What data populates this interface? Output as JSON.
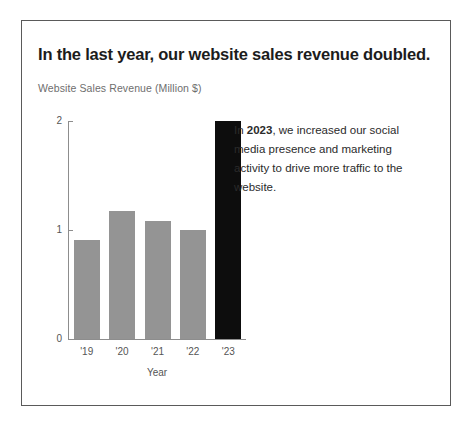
{
  "card": {
    "title": "In the last year, our website sales revenue doubled.",
    "subtitle": "Website Sales Revenue (Million $)"
  },
  "annotation": {
    "highlight": "2023",
    "prefix": "In ",
    "body": ", we increased our social media presence and marketing activity to drive more traffic to the website."
  },
  "colors": {
    "bar_default": "#949494",
    "bar_highlight": "#0d0d0d",
    "axis": "#8d8d8d",
    "card_border": "#5a5a5a",
    "title_text": "#1c1c1c",
    "subtitle_text": "#6e6e6e"
  },
  "chart_data": {
    "type": "bar",
    "title": "In the last year, our website sales revenue doubled.",
    "subtitle": "Website Sales Revenue (Million $)",
    "xlabel": "Year",
    "ylabel": "Website Sales Revenue (Million $)",
    "categories": [
      "'19",
      "'20",
      "'21",
      "'22",
      "'23"
    ],
    "values": [
      0.91,
      1.17,
      1.08,
      1.0,
      2.0
    ],
    "ylim": [
      0,
      2
    ],
    "yticks": [
      "0",
      "1",
      "2"
    ],
    "ytick_values": [
      0,
      1,
      2
    ],
    "grid": false,
    "legend": "none",
    "highlight_category": "'23",
    "bar_colors": [
      "#949494",
      "#949494",
      "#949494",
      "#949494",
      "#0d0d0d"
    ]
  }
}
